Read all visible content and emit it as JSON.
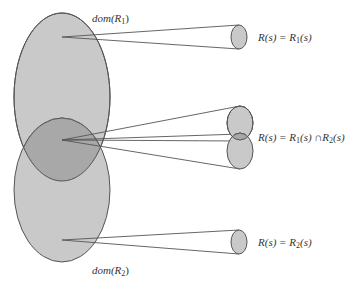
{
  "diagram": {
    "colors": {
      "fill": "#c8c8c8",
      "overlap_fill": "#a9a9a9",
      "stroke": "#555555",
      "line": "#555555",
      "text": "#333333"
    },
    "domains": [
      {
        "id": "R1",
        "label_prefix": "dom(",
        "label_var": "R",
        "label_sub": "1",
        "label_suffix": ")"
      },
      {
        "id": "R2",
        "label_prefix": "dom(",
        "label_var": "R",
        "label_sub": "2",
        "label_suffix": ")"
      }
    ],
    "mappings": [
      {
        "case": "R1 only",
        "equation": "R(s) = R₁(s)"
      },
      {
        "case": "intersection",
        "equation": "R(s) = R₁(s) ∩ R₂(s)"
      },
      {
        "case": "R2 only",
        "equation": "R(s) = R₂(s)"
      }
    ],
    "labels": {
      "dom1": {
        "prefix": "dom(",
        "var": "R",
        "sub": "1",
        "suffix": ")"
      },
      "dom2": {
        "prefix": "dom(",
        "var": "R",
        "sub": "2",
        "suffix": ")"
      },
      "eq1": {
        "lhs": "R(s) = R",
        "sub1": "1",
        "rest1": "(s)"
      },
      "eq2": {
        "lhs": "R(s) = R",
        "sub1": "1",
        "rest1": "(s) ∩R",
        "sub2": "2",
        "rest2": "(s)"
      },
      "eq3": {
        "lhs": "R(s) = R",
        "sub1": "2",
        "rest1": "(s)"
      }
    }
  }
}
